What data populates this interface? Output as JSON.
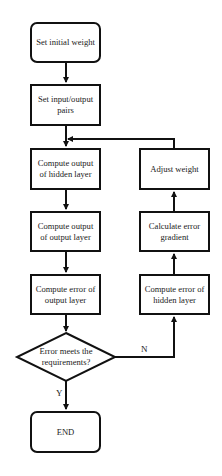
{
  "diagram": {
    "type": "flowchart",
    "title": "",
    "nodes": [
      {
        "id": "n1",
        "shape": "rounded-rect",
        "text": "Set initial weight"
      },
      {
        "id": "n2",
        "shape": "rect",
        "text": "Set input/output pairs"
      },
      {
        "id": "n3",
        "shape": "rect",
        "text": "Compute output of hidden layer"
      },
      {
        "id": "n4",
        "shape": "rect",
        "text": "Compute output of output layer"
      },
      {
        "id": "n5",
        "shape": "rect",
        "text": "Compute error of output layer"
      },
      {
        "id": "n6",
        "shape": "diamond",
        "text": "Error meets the requirements?"
      },
      {
        "id": "n7",
        "shape": "rounded-rect",
        "text": "END"
      },
      {
        "id": "n8",
        "shape": "rect",
        "text": "Compute error of hidden layer"
      },
      {
        "id": "n9",
        "shape": "rect",
        "text": "Calculate error gradient"
      },
      {
        "id": "n10",
        "shape": "rect",
        "text": "Adjust weight"
      }
    ],
    "edges": [
      {
        "from": "n1",
        "to": "n2",
        "label": ""
      },
      {
        "from": "n2",
        "to": "n3",
        "label": ""
      },
      {
        "from": "n3",
        "to": "n4",
        "label": ""
      },
      {
        "from": "n4",
        "to": "n5",
        "label": ""
      },
      {
        "from": "n5",
        "to": "n6",
        "label": ""
      },
      {
        "from": "n6",
        "to": "n7",
        "label": "Y"
      },
      {
        "from": "n6",
        "to": "n8",
        "label": "N"
      },
      {
        "from": "n8",
        "to": "n9",
        "label": ""
      },
      {
        "from": "n9",
        "to": "n10",
        "label": ""
      },
      {
        "from": "n10",
        "to": "n3",
        "label": ""
      }
    ],
    "colors": {
      "stroke": "#111111",
      "fill": "#ffffff",
      "text": "#222222"
    }
  },
  "labels": {
    "set_initial_weight": "Set initial weight",
    "set_io_pairs": "Set input/output pairs",
    "compute_hidden_output": "Compute output of hidden layer",
    "compute_output_output": "Compute output of output layer",
    "compute_output_error": "Compute error of output layer",
    "decision": "Error meets the requirements?",
    "end": "END",
    "compute_hidden_error": "Compute error of hidden layer",
    "calc_gradient": "Calculate error gradient",
    "adjust_weight": "Adjust weight",
    "yes": "Y",
    "no": "N"
  }
}
